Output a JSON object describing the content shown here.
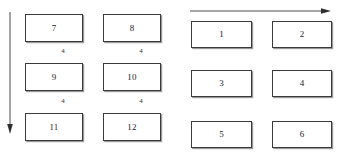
{
  "diagram": {
    "background_color": "#ffffff",
    "box_border_color": "#3a3a3a",
    "box_fill_color": "#ffffff",
    "text_color": "#1d1d1d",
    "arrow_color": "#4a4a4a",
    "left_group": {
      "name": "left-block-group",
      "boxes": [
        {
          "label": "7",
          "x": 25,
          "y": 14,
          "w": 58,
          "h": 28
        },
        {
          "label": "8",
          "x": 103,
          "y": 14,
          "w": 58,
          "h": 28
        },
        {
          "label": "9",
          "x": 25,
          "y": 63,
          "w": 58,
          "h": 28
        },
        {
          "label": "10",
          "x": 103,
          "y": 63,
          "w": 58,
          "h": 28
        },
        {
          "label": "11",
          "x": 25,
          "y": 113,
          "w": 58,
          "h": 28
        },
        {
          "label": "12",
          "x": 103,
          "y": 113,
          "w": 58,
          "h": 28
        }
      ],
      "gap_labels": [
        {
          "text": "4",
          "x": 63,
          "y": 48
        },
        {
          "text": "4",
          "x": 141,
          "y": 48
        },
        {
          "text": "4",
          "x": 63,
          "y": 98
        },
        {
          "text": "4",
          "x": 141,
          "y": 98
        }
      ],
      "arrow": {
        "direction": "down",
        "x": 10,
        "y": 12,
        "length": 122
      }
    },
    "right_group": {
      "name": "right-block-group",
      "boxes": [
        {
          "label": "1",
          "x": 191,
          "y": 21,
          "w": 61,
          "h": 27
        },
        {
          "label": "2",
          "x": 272,
          "y": 21,
          "w": 60,
          "h": 27
        },
        {
          "label": "3",
          "x": 191,
          "y": 70,
          "w": 61,
          "h": 27
        },
        {
          "label": "4",
          "x": 272,
          "y": 70,
          "w": 60,
          "h": 27
        },
        {
          "label": "5",
          "x": 191,
          "y": 121,
          "w": 61,
          "h": 27
        },
        {
          "label": "6",
          "x": 272,
          "y": 121,
          "w": 60,
          "h": 27
        }
      ],
      "gap_labels": [],
      "arrow": {
        "direction": "right",
        "x": 190,
        "y": 11,
        "length": 141
      }
    }
  }
}
